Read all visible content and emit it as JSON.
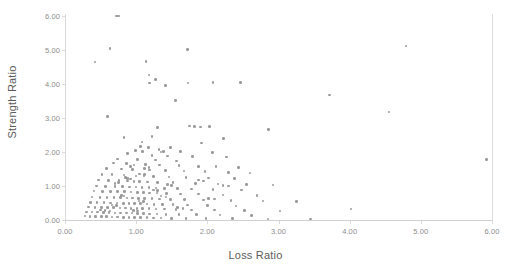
{
  "chart_data": {
    "type": "scatter",
    "title": "",
    "xlabel": "Loss Ratio",
    "ylabel": "Strength Ratio",
    "xlim": [
      0.0,
      6.0
    ],
    "ylim": [
      0.0,
      6.0
    ],
    "grid": false,
    "legend": null,
    "marker": {
      "shape": "circle",
      "color": "#9b9b9b",
      "size_px": 2.6
    },
    "xticks": [
      "0.00",
      "1.00",
      "2.00",
      "3.00",
      "4.00",
      "5.00",
      "6.00"
    ],
    "yticks": [
      "0.00",
      "1.00",
      "2.00",
      "3.00",
      "4.00",
      "5.00",
      "6.00"
    ],
    "xtick_values": [
      0,
      1,
      2,
      3,
      4,
      5,
      6
    ],
    "ytick_values": [
      0,
      1,
      2,
      3,
      4,
      5,
      6
    ],
    "series": [
      {
        "name": "observations",
        "points": [
          [
            0.72,
            6.0
          ],
          [
            0.75,
            6.0
          ],
          [
            0.63,
            5.05
          ],
          [
            4.79,
            5.12
          ],
          [
            1.72,
            5.02
          ],
          [
            0.42,
            4.65
          ],
          [
            1.14,
            4.66
          ],
          [
            1.18,
            4.27
          ],
          [
            1.27,
            4.13
          ],
          [
            1.19,
            4.03
          ],
          [
            1.41,
            3.96
          ],
          [
            1.73,
            4.03
          ],
          [
            2.08,
            4.04
          ],
          [
            2.47,
            4.05
          ],
          [
            3.72,
            3.68
          ],
          [
            1.55,
            3.52
          ],
          [
            4.55,
            3.18
          ],
          [
            0.6,
            3.04
          ],
          [
            1.3,
            2.72
          ],
          [
            1.82,
            2.75
          ],
          [
            1.9,
            2.73
          ],
          [
            2.03,
            2.75
          ],
          [
            1.75,
            2.76
          ],
          [
            2.86,
            2.66
          ],
          [
            1.22,
            2.45
          ],
          [
            0.83,
            2.42
          ],
          [
            2.23,
            2.4
          ],
          [
            1.08,
            2.3
          ],
          [
            1.92,
            2.26
          ],
          [
            1.06,
            2.17
          ],
          [
            1.17,
            2.14
          ],
          [
            1.48,
            2.13
          ],
          [
            1.32,
            2.08
          ],
          [
            0.99,
            2.05
          ],
          [
            1.09,
            2.02
          ],
          [
            1.35,
            2.0
          ],
          [
            1.38,
            2.01
          ],
          [
            1.62,
            2.02
          ],
          [
            2.07,
            1.99
          ],
          [
            0.88,
            1.96
          ],
          [
            1.22,
            1.9
          ],
          [
            1.44,
            1.88
          ],
          [
            1.79,
            1.86
          ],
          [
            2.27,
            1.85
          ],
          [
            0.74,
            1.8
          ],
          [
            1.02,
            1.78
          ],
          [
            1.27,
            1.76
          ],
          [
            1.57,
            1.73
          ],
          [
            5.92,
            1.78
          ],
          [
            0.68,
            1.68
          ],
          [
            0.86,
            1.66
          ],
          [
            1.13,
            1.64
          ],
          [
            1.33,
            1.62
          ],
          [
            1.6,
            1.6
          ],
          [
            1.88,
            1.58
          ],
          [
            2.12,
            1.57
          ],
          [
            2.44,
            1.55
          ],
          [
            0.58,
            1.52
          ],
          [
            0.79,
            1.5
          ],
          [
            0.95,
            1.49
          ],
          [
            1.19,
            1.47
          ],
          [
            1.41,
            1.45
          ],
          [
            1.67,
            1.44
          ],
          [
            1.97,
            1.42
          ],
          [
            2.3,
            1.4
          ],
          [
            2.6,
            1.38
          ],
          [
            0.52,
            1.34
          ],
          [
            0.66,
            1.33
          ],
          [
            0.83,
            1.32
          ],
          [
            1.0,
            1.3
          ],
          [
            1.11,
            1.29
          ],
          [
            1.24,
            1.28
          ],
          [
            1.46,
            1.26
          ],
          [
            1.7,
            1.25
          ],
          [
            2.02,
            1.23
          ],
          [
            2.38,
            1.22
          ],
          [
            0.47,
            1.18
          ],
          [
            0.61,
            1.17
          ],
          [
            0.76,
            1.16
          ],
          [
            0.88,
            1.15
          ],
          [
            0.97,
            1.14
          ],
          [
            1.05,
            1.13
          ],
          [
            1.16,
            1.12
          ],
          [
            1.3,
            1.11
          ],
          [
            1.52,
            1.1
          ],
          [
            1.83,
            1.08
          ],
          [
            2.15,
            1.06
          ],
          [
            2.55,
            1.05
          ],
          [
            2.92,
            1.03
          ],
          [
            0.44,
            1.0
          ],
          [
            0.57,
            0.99
          ],
          [
            0.7,
            0.99
          ],
          [
            0.81,
            0.98
          ],
          [
            0.91,
            0.97
          ],
          [
            1.0,
            0.97
          ],
          [
            1.08,
            0.96
          ],
          [
            1.18,
            0.95
          ],
          [
            1.28,
            0.94
          ],
          [
            1.4,
            0.93
          ],
          [
            1.58,
            0.92
          ],
          [
            1.78,
            0.91
          ],
          [
            2.08,
            0.9
          ],
          [
            2.48,
            0.88
          ],
          [
            0.41,
            0.85
          ],
          [
            0.53,
            0.84
          ],
          [
            0.64,
            0.84
          ],
          [
            0.74,
            0.83
          ],
          [
            0.84,
            0.83
          ],
          [
            0.93,
            0.82
          ],
          [
            1.02,
            0.81
          ],
          [
            1.1,
            0.81
          ],
          [
            1.19,
            0.8
          ],
          [
            1.29,
            0.79
          ],
          [
            1.43,
            0.78
          ],
          [
            1.62,
            0.77
          ],
          [
            1.88,
            0.76
          ],
          [
            2.22,
            0.74
          ],
          [
            2.7,
            0.72
          ],
          [
            0.38,
            0.68
          ],
          [
            0.49,
            0.67
          ],
          [
            0.59,
            0.67
          ],
          [
            0.69,
            0.66
          ],
          [
            0.78,
            0.66
          ],
          [
            0.87,
            0.65
          ],
          [
            0.95,
            0.65
          ],
          [
            1.03,
            0.64
          ],
          [
            1.12,
            0.63
          ],
          [
            1.22,
            0.63
          ],
          [
            1.33,
            0.62
          ],
          [
            1.48,
            0.61
          ],
          [
            1.68,
            0.6
          ],
          [
            1.95,
            0.59
          ],
          [
            2.33,
            0.58
          ],
          [
            2.78,
            0.56
          ],
          [
            3.25,
            0.54
          ],
          [
            0.36,
            0.52
          ],
          [
            0.45,
            0.51
          ],
          [
            0.55,
            0.51
          ],
          [
            0.64,
            0.5
          ],
          [
            0.73,
            0.5
          ],
          [
            0.82,
            0.49
          ],
          [
            0.9,
            0.49
          ],
          [
            0.98,
            0.48
          ],
          [
            1.06,
            0.48
          ],
          [
            1.15,
            0.47
          ],
          [
            1.25,
            0.46
          ],
          [
            1.37,
            0.46
          ],
          [
            1.52,
            0.45
          ],
          [
            1.72,
            0.44
          ],
          [
            2.0,
            0.43
          ],
          [
            2.4,
            0.41
          ],
          [
            4.02,
            0.32
          ],
          [
            0.33,
            0.38
          ],
          [
            0.42,
            0.37
          ],
          [
            0.51,
            0.37
          ],
          [
            0.6,
            0.36
          ],
          [
            0.68,
            0.36
          ],
          [
            0.77,
            0.35
          ],
          [
            0.85,
            0.35
          ],
          [
            0.93,
            0.34
          ],
          [
            1.01,
            0.34
          ],
          [
            1.09,
            0.33
          ],
          [
            1.18,
            0.33
          ],
          [
            1.28,
            0.32
          ],
          [
            1.4,
            0.32
          ],
          [
            1.56,
            0.31
          ],
          [
            1.78,
            0.3
          ],
          [
            2.1,
            0.29
          ],
          [
            2.52,
            0.28
          ],
          [
            3.02,
            0.26
          ],
          [
            0.3,
            0.24
          ],
          [
            0.38,
            0.23
          ],
          [
            0.46,
            0.23
          ],
          [
            0.54,
            0.22
          ],
          [
            0.62,
            0.22
          ],
          [
            0.7,
            0.21
          ],
          [
            0.78,
            0.21
          ],
          [
            0.86,
            0.2
          ],
          [
            0.94,
            0.2
          ],
          [
            1.02,
            0.19
          ],
          [
            1.1,
            0.19
          ],
          [
            1.19,
            0.18
          ],
          [
            1.29,
            0.18
          ],
          [
            1.42,
            0.17
          ],
          [
            1.6,
            0.17
          ],
          [
            1.85,
            0.16
          ],
          [
            2.18,
            0.15
          ],
          [
            2.62,
            0.14
          ],
          [
            0.28,
            0.12
          ],
          [
            0.35,
            0.11
          ],
          [
            0.43,
            0.11
          ],
          [
            0.51,
            0.1
          ],
          [
            0.58,
            0.1
          ],
          [
            0.66,
            0.09
          ],
          [
            0.74,
            0.09
          ],
          [
            0.82,
            0.08
          ],
          [
            0.9,
            0.08
          ],
          [
            0.98,
            0.07
          ],
          [
            1.06,
            0.07
          ],
          [
            1.15,
            0.07
          ],
          [
            1.24,
            0.06
          ],
          [
            1.35,
            0.06
          ],
          [
            1.5,
            0.05
          ],
          [
            1.7,
            0.05
          ],
          [
            1.98,
            0.04
          ],
          [
            2.35,
            0.04
          ],
          [
            2.85,
            0.03
          ],
          [
            3.45,
            0.03
          ],
          [
            0.5,
            0.3
          ],
          [
            0.56,
            0.28
          ],
          [
            0.63,
            0.27
          ],
          [
            0.88,
            1.22
          ],
          [
            0.92,
            1.2
          ],
          [
            0.85,
            1.25
          ],
          [
            1.05,
            1.35
          ],
          [
            1.12,
            1.33
          ],
          [
            0.79,
            0.72
          ],
          [
            0.83,
            0.7
          ],
          [
            1.04,
            0.56
          ],
          [
            1.1,
            0.54
          ],
          [
            1.24,
            0.88
          ],
          [
            1.3,
            0.86
          ],
          [
            1.44,
            1.04
          ],
          [
            1.5,
            1.02
          ],
          [
            1.12,
            1.52
          ],
          [
            1.18,
            1.55
          ],
          [
            0.97,
            1.62
          ],
          [
            0.92,
            1.58
          ],
          [
            0.75,
            1.1
          ],
          [
            0.7,
            1.08
          ],
          [
            1.35,
            0.7
          ],
          [
            1.42,
            0.68
          ],
          [
            0.66,
            0.44
          ],
          [
            0.72,
            0.42
          ],
          [
            1.58,
            0.36
          ],
          [
            1.66,
            0.34
          ],
          [
            2.02,
            0.64
          ],
          [
            2.1,
            0.62
          ],
          [
            1.88,
            1.18
          ],
          [
            1.95,
            1.15
          ],
          [
            2.22,
            1.02
          ],
          [
            2.3,
            1.0
          ],
          [
            0.96,
            0.28
          ],
          [
            1.02,
            0.26
          ]
        ]
      }
    ]
  }
}
